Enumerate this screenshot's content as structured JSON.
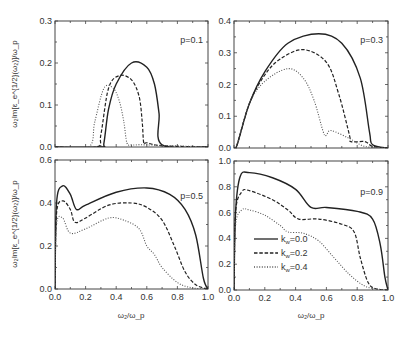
{
  "figure": {
    "xlabel": "ω₂/ω_p",
    "ylabel": "ω₂Im[ε_e^{1/2}(ω₂)]/ω_p",
    "legend": [
      "k_w=0.0",
      "k_w=0.2",
      "k_w=0.4"
    ]
  },
  "chart_data": [
    {
      "type": "line",
      "title": "p=0.1",
      "xlabel": "",
      "ylabel": "ω₂Im[ε_e^{1/2}(ω₂)]/ω_p",
      "xlim": [
        0,
        1
      ],
      "ylim": [
        0,
        0.3
      ],
      "yticks": [
        0.0,
        0.1,
        0.2,
        0.3
      ],
      "series": [
        {
          "name": "k_w=0.0",
          "style": "solid",
          "x": [
            0,
            0.3,
            0.32,
            0.35,
            0.4,
            0.5,
            0.6,
            0.65,
            0.68,
            0.7,
            1
          ],
          "y": [
            0,
            0,
            0.01,
            0.09,
            0.15,
            0.2,
            0.19,
            0.15,
            0.08,
            0.005,
            0
          ]
        },
        {
          "name": "k_w=0.2",
          "style": "dashed",
          "x": [
            0,
            0.27,
            0.3,
            0.35,
            0.42,
            0.5,
            0.55,
            0.57,
            0.58,
            0.6,
            0.7,
            1
          ],
          "y": [
            0,
            0,
            0.03,
            0.14,
            0.17,
            0.16,
            0.12,
            0.06,
            0.01,
            0.01,
            0.003,
            0
          ]
        },
        {
          "name": "k_w=0.4",
          "style": "dotted",
          "x": [
            0,
            0.22,
            0.26,
            0.32,
            0.38,
            0.42,
            0.45,
            0.47,
            0.5,
            0.6,
            1
          ],
          "y": [
            0,
            0,
            0.06,
            0.14,
            0.14,
            0.11,
            0.06,
            0.01,
            0.005,
            0.005,
            0
          ]
        }
      ]
    },
    {
      "type": "line",
      "title": "p=0.3",
      "xlim": [
        0,
        1
      ],
      "ylim": [
        0,
        0.4
      ],
      "yticks": [
        0.0,
        0.1,
        0.2,
        0.3,
        0.4
      ],
      "series": [
        {
          "name": "k_w=0.0",
          "style": "solid",
          "x": [
            0,
            0.02,
            0.1,
            0.2,
            0.35,
            0.55,
            0.7,
            0.82,
            0.88,
            0.9,
            1
          ],
          "y": [
            0,
            0.01,
            0.14,
            0.24,
            0.33,
            0.36,
            0.33,
            0.22,
            0.05,
            0.01,
            0
          ]
        },
        {
          "name": "k_w=0.2",
          "style": "dashed",
          "x": [
            0,
            0.02,
            0.1,
            0.2,
            0.3,
            0.45,
            0.6,
            0.68,
            0.75,
            0.76,
            0.85,
            0.9,
            1
          ],
          "y": [
            0,
            0.01,
            0.14,
            0.23,
            0.28,
            0.31,
            0.27,
            0.17,
            0.04,
            0.02,
            0.02,
            0.005,
            0
          ]
        },
        {
          "name": "k_w=0.4",
          "style": "dotted",
          "x": [
            0,
            0.02,
            0.1,
            0.2,
            0.35,
            0.45,
            0.52,
            0.58,
            0.6,
            0.63,
            0.75,
            0.85,
            1
          ],
          "y": [
            0,
            0.01,
            0.14,
            0.21,
            0.25,
            0.22,
            0.15,
            0.05,
            0.04,
            0.055,
            0.03,
            0.005,
            0
          ]
        }
      ]
    },
    {
      "type": "line",
      "title": "p=0.5",
      "xlabel": "ω₂/ω_p",
      "ylabel": "ω₂Im[ε_e^{1/2}(ω₂)]/ω_p",
      "xlim": [
        0,
        1
      ],
      "ylim": [
        0,
        0.6
      ],
      "xticks": [
        0.0,
        0.2,
        0.4,
        0.6,
        0.8,
        1.0
      ],
      "yticks": [
        0.0,
        0.2,
        0.4,
        0.6
      ],
      "series": [
        {
          "name": "k_w=0.0",
          "style": "solid",
          "x": [
            0,
            0.01,
            0.05,
            0.1,
            0.14,
            0.2,
            0.4,
            0.6,
            0.75,
            0.85,
            0.92,
            0.97,
            1
          ],
          "y": [
            0,
            0.4,
            0.48,
            0.44,
            0.37,
            0.39,
            0.45,
            0.47,
            0.44,
            0.37,
            0.25,
            0.05,
            0
          ]
        },
        {
          "name": "k_w=0.2",
          "style": "dashed",
          "x": [
            0,
            0.01,
            0.05,
            0.1,
            0.13,
            0.2,
            0.35,
            0.5,
            0.6,
            0.7,
            0.78,
            0.85,
            0.92,
            1
          ],
          "y": [
            0,
            0.35,
            0.41,
            0.37,
            0.31,
            0.33,
            0.39,
            0.4,
            0.38,
            0.32,
            0.2,
            0.08,
            0.02,
            0
          ]
        },
        {
          "name": "k_w=0.4",
          "style": "dotted",
          "x": [
            0,
            0.01,
            0.05,
            0.1,
            0.2,
            0.35,
            0.45,
            0.55,
            0.6,
            0.65,
            0.7,
            0.8,
            0.9,
            1
          ],
          "y": [
            0,
            0.3,
            0.33,
            0.26,
            0.28,
            0.33,
            0.32,
            0.28,
            0.2,
            0.16,
            0.1,
            0.03,
            0.005,
            0
          ]
        }
      ]
    },
    {
      "type": "line",
      "title": "p=0.9",
      "xlabel": "ω₂/ω_p",
      "xlim": [
        0,
        1
      ],
      "ylim": [
        0,
        1.0
      ],
      "xticks": [
        0.0,
        0.2,
        0.4,
        0.6,
        0.8,
        1.0
      ],
      "yticks": [
        0.0,
        0.2,
        0.4,
        0.6,
        0.8,
        1.0
      ],
      "legend": {
        "entries": [
          "k_w=0.0",
          "k_w=0.2",
          "k_w=0.4"
        ],
        "position": "lower left"
      },
      "series": [
        {
          "name": "k_w=0.0",
          "style": "solid",
          "x": [
            0,
            0.01,
            0.04,
            0.1,
            0.25,
            0.4,
            0.5,
            0.6,
            0.8,
            0.9,
            0.95,
            0.98,
            1
          ],
          "y": [
            0,
            0.6,
            0.88,
            0.91,
            0.87,
            0.78,
            0.64,
            0.64,
            0.61,
            0.55,
            0.35,
            0.1,
            0
          ]
        },
        {
          "name": "k_w=0.2",
          "style": "dashed",
          "x": [
            0,
            0.01,
            0.05,
            0.1,
            0.25,
            0.35,
            0.42,
            0.55,
            0.7,
            0.78,
            0.82,
            0.87,
            0.92,
            1
          ],
          "y": [
            0,
            0.6,
            0.76,
            0.77,
            0.7,
            0.62,
            0.55,
            0.55,
            0.51,
            0.45,
            0.25,
            0.06,
            0.01,
            0
          ]
        },
        {
          "name": "k_w=0.4",
          "style": "dotted",
          "x": [
            0,
            0.01,
            0.05,
            0.1,
            0.2,
            0.3,
            0.35,
            0.45,
            0.55,
            0.65,
            0.75,
            0.85,
            0.95,
            1
          ],
          "y": [
            0,
            0.5,
            0.62,
            0.62,
            0.58,
            0.5,
            0.45,
            0.44,
            0.38,
            0.25,
            0.12,
            0.03,
            0.005,
            0
          ]
        }
      ]
    }
  ]
}
